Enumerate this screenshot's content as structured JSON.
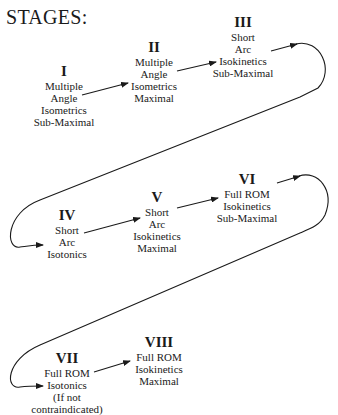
{
  "title": "STAGES:",
  "stages": [
    {
      "numeral": "I",
      "lines": [
        "Multiple",
        "Angle",
        "Isometrics",
        "Sub-Maximal"
      ]
    },
    {
      "numeral": "II",
      "lines": [
        "Multiple",
        "Angle",
        "Isometrics",
        "Maximal"
      ]
    },
    {
      "numeral": "III",
      "lines": [
        "Short",
        "Arc",
        "Isokinetics",
        "Sub-Maximal"
      ]
    },
    {
      "numeral": "IV",
      "lines": [
        "Short",
        "Arc",
        "Isotonics"
      ]
    },
    {
      "numeral": "V",
      "lines": [
        "Short",
        "Arc",
        "Isokinetics",
        "Maximal"
      ]
    },
    {
      "numeral": "VI",
      "lines": [
        "Full ROM",
        "Isokinetics",
        "Sub-Maximal"
      ]
    },
    {
      "numeral": "VII",
      "lines": [
        "Full ROM",
        "Isotonics",
        "(If not",
        "contraindicated)"
      ]
    },
    {
      "numeral": "VIII",
      "lines": [
        "Full ROM",
        "Isokinetics",
        "Maximal"
      ]
    }
  ],
  "flow": [
    "I",
    "II",
    "III",
    "IV",
    "V",
    "VI",
    "VII",
    "VIII"
  ]
}
